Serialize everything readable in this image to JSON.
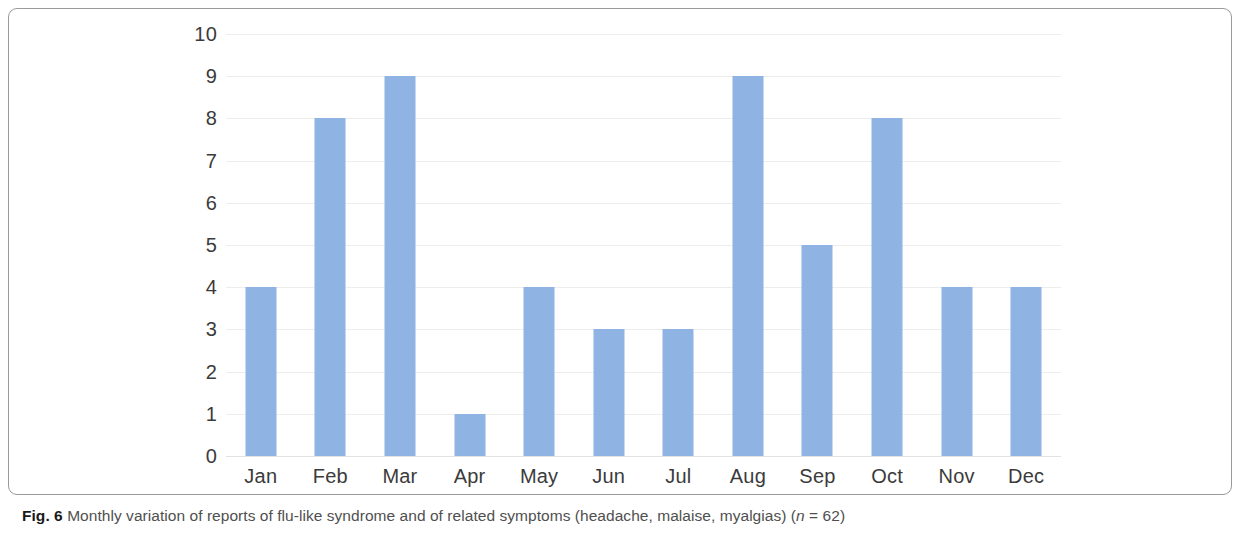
{
  "figure": {
    "label": "Fig. 6",
    "caption": "Monthly variation of reports of flu-like syndrome and of related symptoms (headache, malaise, myalgias)",
    "n_prefix": "(",
    "n_symbol": "n",
    "n_value": " = 62)"
  },
  "style": {
    "bar_color": "#8FB3E2",
    "gridline_color": "#EDEDED",
    "axis_text_color": "#3B3B3B",
    "caption_color": "#4F4F4F",
    "border_color": "#9A9A9A"
  },
  "chart_data": {
    "type": "bar",
    "title": "",
    "subtitle": "",
    "xlabel": "",
    "ylabel": "",
    "categories": [
      "Jan",
      "Feb",
      "Mar",
      "Apr",
      "May",
      "Jun",
      "Jul",
      "Aug",
      "Sep",
      "Oct",
      "Nov",
      "Dec"
    ],
    "values": [
      4,
      8,
      9,
      1,
      4,
      3,
      3,
      9,
      5,
      8,
      4,
      4
    ],
    "total": 62,
    "ylim": [
      0,
      10
    ],
    "ytick_labels": [
      "0",
      "1",
      "2",
      "3",
      "4",
      "5",
      "6",
      "7",
      "8",
      "9",
      "10"
    ],
    "ytick_values": [
      0,
      1,
      2,
      3,
      4,
      5,
      6,
      7,
      8,
      9,
      10
    ],
    "grid": true,
    "grid_axis": "y",
    "legend": false,
    "legend_position": "none",
    "series": [
      {
        "name": "Reports of flu-like syndrome and related symptoms",
        "values": [
          4,
          8,
          9,
          1,
          4,
          3,
          3,
          9,
          5,
          8,
          4,
          4
        ]
      }
    ]
  }
}
